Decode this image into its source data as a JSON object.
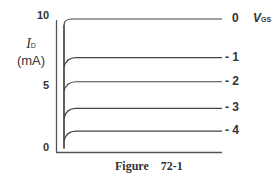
{
  "chart_data": {
    "type": "line",
    "title": "",
    "caption": "Figure    72-1",
    "xlabel": "",
    "ylabel": "I_D (mA)",
    "ylabel_symbol": "I",
    "ylabel_sub": "D",
    "ylabel_unit": "(mA)",
    "ylim": [
      0,
      10
    ],
    "yticks": [
      "0",
      "5",
      "10"
    ],
    "legend_title": "V",
    "legend_title_sub": "GS",
    "grid": false,
    "series": [
      {
        "name": "0",
        "label": "0",
        "saturation_value": 10.0
      },
      {
        "name": "-1",
        "label": "- 1",
        "saturation_value": 7.1
      },
      {
        "name": "-2",
        "label": "- 2",
        "saturation_value": 5.3
      },
      {
        "name": "-3",
        "label": "- 3",
        "saturation_value": 3.3
      },
      {
        "name": "-4",
        "label": "- 4",
        "saturation_value": 1.6
      }
    ]
  }
}
